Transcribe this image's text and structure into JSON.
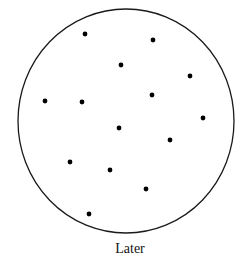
{
  "caption": "Later",
  "colors": {
    "stroke": "#1a1a1a",
    "dot": "#000000",
    "background": "#ffffff"
  },
  "circle": {
    "cx": 126,
    "cy": 121,
    "rx": 108,
    "ry": 112
  },
  "dots": [
    {
      "x": 85,
      "y": 34
    },
    {
      "x": 153,
      "y": 40
    },
    {
      "x": 121,
      "y": 65
    },
    {
      "x": 190,
      "y": 76
    },
    {
      "x": 152,
      "y": 95
    },
    {
      "x": 45,
      "y": 101
    },
    {
      "x": 82,
      "y": 102
    },
    {
      "x": 203,
      "y": 118
    },
    {
      "x": 119,
      "y": 128
    },
    {
      "x": 170,
      "y": 140
    },
    {
      "x": 70,
      "y": 162
    },
    {
      "x": 110,
      "y": 170
    },
    {
      "x": 146,
      "y": 189
    },
    {
      "x": 89,
      "y": 214
    }
  ]
}
